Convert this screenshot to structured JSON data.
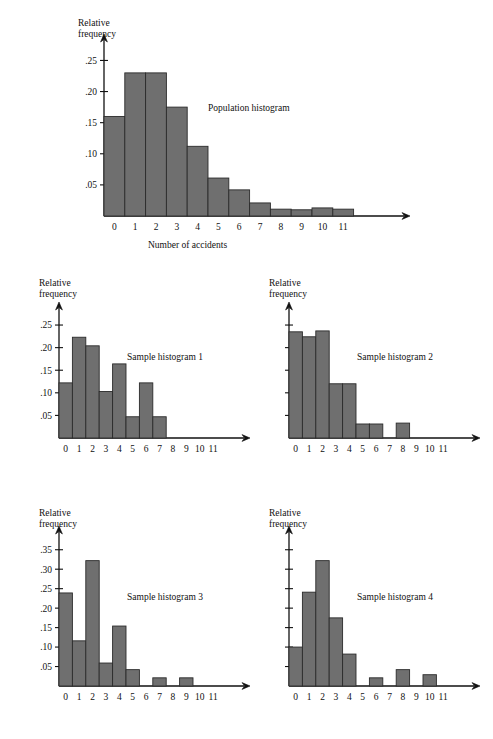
{
  "figure": {
    "ylabel": "Relative\nfrequency",
    "xlabel": "Number of accidents",
    "bar_color": "#6f6f6f",
    "bar_edge_color": "#2b2b2b",
    "axis_color": "#111111"
  },
  "chart_data": [
    {
      "type": "bar",
      "title": "Population histogram",
      "xlabel": "Number of accidents",
      "ylabel": "Relative frequency",
      "categories": [
        "0",
        "1",
        "2",
        "3",
        "4",
        "5",
        "6",
        "7",
        "8",
        "9",
        "10",
        "11"
      ],
      "values": [
        0.16,
        0.23,
        0.23,
        0.175,
        0.112,
        0.061,
        0.042,
        0.021,
        0.011,
        0.01,
        0.013,
        0.011
      ],
      "yticks": [
        0.05,
        0.1,
        0.15,
        0.2,
        0.25
      ],
      "yticklabels": [
        ".05",
        ".10",
        ".15",
        ".20",
        ".25"
      ],
      "ylim": [
        0,
        0.27
      ],
      "grid": false,
      "legend": "none"
    },
    {
      "type": "bar",
      "title": "Sample histogram 1",
      "xlabel": "",
      "ylabel": "Relative frequency",
      "categories": [
        "0",
        "1",
        "2",
        "3",
        "4",
        "5",
        "6",
        "7",
        "8",
        "9",
        "10",
        "11"
      ],
      "values": [
        0.122,
        0.223,
        0.204,
        0.103,
        0.164,
        0.047,
        0.122,
        0.047,
        0,
        0,
        0,
        0
      ],
      "yticks": [
        0.05,
        0.1,
        0.15,
        0.2,
        0.25
      ],
      "yticklabels": [
        ".05",
        ".10",
        ".15",
        ".20",
        ".25"
      ],
      "ylim": [
        0,
        0.27
      ],
      "grid": false,
      "legend": "none"
    },
    {
      "type": "bar",
      "title": "Sample histogram 2",
      "xlabel": "",
      "ylabel": "Relative frequency",
      "categories": [
        "0",
        "1",
        "2",
        "3",
        "4",
        "5",
        "6",
        "7",
        "8",
        "9",
        "10",
        "11"
      ],
      "values": [
        0.235,
        0.224,
        0.237,
        0.12,
        0.12,
        0.031,
        0.031,
        0,
        0.033,
        0,
        0,
        0
      ],
      "yticks": [
        0.05,
        0.1,
        0.15,
        0.2,
        0.25
      ],
      "yticklabels": [
        "",
        "",
        "",
        "",
        ""
      ],
      "ylim": [
        0,
        0.27
      ],
      "grid": false,
      "legend": "none"
    },
    {
      "type": "bar",
      "title": "Sample histogram 3",
      "xlabel": "",
      "ylabel": "Relative frequency",
      "categories": [
        "0",
        "1",
        "2",
        "3",
        "4",
        "5",
        "6",
        "7",
        "8",
        "9",
        "10",
        "11"
      ],
      "values": [
        0.239,
        0.116,
        0.322,
        0.059,
        0.154,
        0.042,
        0,
        0.021,
        0,
        0.021,
        0,
        0
      ],
      "yticks": [
        0.05,
        0.1,
        0.15,
        0.2,
        0.25,
        0.3,
        0.35
      ],
      "yticklabels": [
        ".05",
        ".10",
        ".15",
        ".20",
        ".25",
        ".30",
        ".35"
      ],
      "ylim": [
        0,
        0.375
      ],
      "grid": false,
      "legend": "none"
    },
    {
      "type": "bar",
      "title": "Sample histogram 4",
      "xlabel": "",
      "ylabel": "Relative frequency",
      "categories": [
        "0",
        "1",
        "2",
        "3",
        "4",
        "5",
        "6",
        "7",
        "8",
        "9",
        "10",
        "11"
      ],
      "values": [
        0.1,
        0.241,
        0.322,
        0.175,
        0.082,
        0,
        0.021,
        0,
        0.042,
        0,
        0.029,
        0
      ],
      "yticks": [
        0.05,
        0.1,
        0.15,
        0.2,
        0.25,
        0.3,
        0.35
      ],
      "yticklabels": [
        "",
        "",
        "",
        "",
        "",
        "",
        ""
      ],
      "ylim": [
        0,
        0.375
      ],
      "grid": false,
      "legend": "none"
    }
  ]
}
